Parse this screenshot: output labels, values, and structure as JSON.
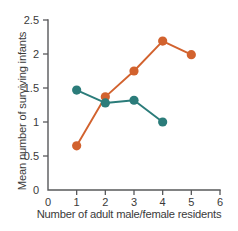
{
  "chart_data": {
    "type": "line",
    "title": "",
    "xlabel": "Number of adult male/female residents",
    "ylabel": "Mean number of surviving infants",
    "xlim": [
      0,
      6
    ],
    "ylim": [
      0,
      2.5
    ],
    "xticks": [
      "0",
      "1",
      "2",
      "3",
      "4",
      "5",
      "6"
    ],
    "yticks": [
      "0",
      "0.5",
      "1",
      "1.5",
      "2",
      "2.5"
    ],
    "grid": false,
    "legend": "none",
    "series": [
      {
        "name": "orange-series",
        "color": "#d2622e",
        "x": [
          1,
          2,
          3,
          4,
          5
        ],
        "values": [
          0.65,
          1.37,
          1.75,
          2.19,
          1.99
        ]
      },
      {
        "name": "teal-series",
        "color": "#2b7c7a",
        "x": [
          1,
          2,
          3,
          4
        ],
        "values": [
          1.47,
          1.28,
          1.32,
          1.0
        ]
      }
    ]
  }
}
